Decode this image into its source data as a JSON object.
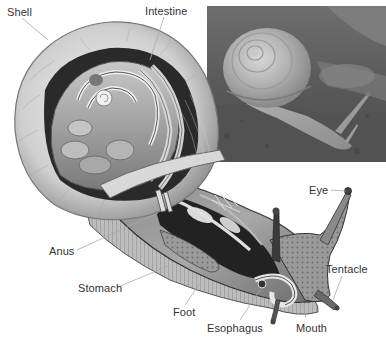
{
  "diagram": {
    "labels": [
      {
        "id": "shell",
        "text": "Shell",
        "x": 7,
        "y": 6
      },
      {
        "id": "intestine",
        "text": "Intestine",
        "x": 145,
        "y": 5
      },
      {
        "id": "eye",
        "text": "Eye",
        "x": 309,
        "y": 184
      },
      {
        "id": "anus",
        "text": "Anus",
        "x": 49,
        "y": 245
      },
      {
        "id": "tentacle",
        "text": "Tentacle",
        "x": 326,
        "y": 263
      },
      {
        "id": "stomach",
        "text": "Stomach",
        "x": 78,
        "y": 282
      },
      {
        "id": "foot",
        "text": "Foot",
        "x": 173,
        "y": 306
      },
      {
        "id": "esophagus",
        "text": "Esophagus",
        "x": 207,
        "y": 322
      },
      {
        "id": "mouth",
        "text": "Mouth",
        "x": 296,
        "y": 322
      }
    ],
    "inset_photo": {
      "description": "Photograph of a live garden snail crawling on a rock"
    },
    "colors": {
      "background": "#ffffff",
      "label_text": "#333333",
      "leader_line": "#aaaaaa"
    }
  }
}
